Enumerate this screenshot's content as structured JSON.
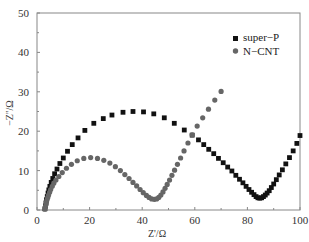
{
  "chart_data": {
    "type": "scatter",
    "title": "",
    "xlabel": "Z'/Ω",
    "ylabel": "−Z''/Ω",
    "xlim": [
      0,
      100
    ],
    "ylim": [
      0,
      50
    ],
    "xticks": [
      0,
      20,
      40,
      60,
      80,
      100
    ],
    "yticks": [
      0,
      10,
      20,
      30,
      40,
      50
    ],
    "grid": false,
    "legend_position": "upper right",
    "series": [
      {
        "name": "super−P",
        "marker": "square",
        "color": "#111111",
        "points": [
          [
            3.0,
            0.3
          ],
          [
            3.2,
            1.0
          ],
          [
            3.4,
            1.8
          ],
          [
            3.6,
            2.6
          ],
          [
            3.9,
            3.4
          ],
          [
            4.2,
            4.3
          ],
          [
            4.5,
            5.1
          ],
          [
            4.9,
            6.0
          ],
          [
            5.4,
            7.0
          ],
          [
            6.0,
            8.0
          ],
          [
            6.7,
            9.2
          ],
          [
            7.6,
            10.4
          ],
          [
            8.7,
            11.8
          ],
          [
            10.0,
            13.2
          ],
          [
            11.6,
            14.9
          ],
          [
            13.4,
            16.6
          ],
          [
            15.6,
            18.3
          ],
          [
            18.2,
            20.2
          ],
          [
            21.6,
            22.0
          ],
          [
            25.2,
            23.2
          ],
          [
            28.5,
            24.1
          ],
          [
            32.7,
            24.8
          ],
          [
            36.5,
            25.0
          ],
          [
            40.5,
            24.9
          ],
          [
            44.4,
            24.4
          ],
          [
            48.4,
            23.4
          ],
          [
            52.2,
            22.0
          ],
          [
            56.0,
            20.3
          ],
          [
            59.0,
            19.0
          ],
          [
            61.4,
            17.8
          ],
          [
            63.4,
            16.6
          ],
          [
            65.3,
            15.4
          ],
          [
            67.2,
            14.3
          ],
          [
            69.0,
            13.1
          ],
          [
            70.8,
            12.0
          ],
          [
            72.5,
            10.9
          ],
          [
            74.1,
            9.9
          ],
          [
            75.6,
            8.8
          ],
          [
            77.0,
            7.8
          ],
          [
            78.3,
            6.9
          ],
          [
            79.5,
            6.0
          ],
          [
            80.6,
            5.2
          ],
          [
            81.6,
            4.5
          ],
          [
            82.5,
            3.9
          ],
          [
            83.3,
            3.4
          ],
          [
            84.0,
            3.1
          ],
          [
            84.7,
            3.0
          ],
          [
            85.4,
            3.1
          ],
          [
            86.1,
            3.4
          ],
          [
            86.8,
            3.8
          ],
          [
            87.5,
            4.3
          ],
          [
            88.3,
            4.9
          ],
          [
            89.1,
            5.7
          ],
          [
            90.0,
            6.6
          ],
          [
            91.0,
            7.7
          ],
          [
            92.1,
            8.9
          ],
          [
            93.3,
            10.2
          ],
          [
            94.6,
            11.7
          ],
          [
            96.0,
            13.3
          ],
          [
            97.4,
            15.0
          ],
          [
            98.8,
            16.9
          ],
          [
            100.0,
            18.9
          ]
        ]
      },
      {
        "name": "N−CNT",
        "marker": "circle",
        "color": "#666666",
        "points": [
          [
            3.0,
            0.2
          ],
          [
            3.2,
            0.8
          ],
          [
            3.4,
            1.4
          ],
          [
            3.6,
            2.0
          ],
          [
            3.8,
            2.6
          ],
          [
            4.1,
            3.2
          ],
          [
            4.4,
            3.8
          ],
          [
            4.8,
            4.5
          ],
          [
            5.2,
            5.2
          ],
          [
            5.8,
            6.0
          ],
          [
            6.4,
            6.8
          ],
          [
            7.2,
            7.6
          ],
          [
            8.3,
            8.5
          ],
          [
            9.6,
            9.5
          ],
          [
            11.2,
            10.6
          ],
          [
            13.1,
            11.6
          ],
          [
            15.3,
            12.5
          ],
          [
            17.8,
            13.1
          ],
          [
            20.4,
            13.3
          ],
          [
            23.0,
            13.1
          ],
          [
            25.4,
            12.6
          ],
          [
            27.7,
            11.9
          ],
          [
            29.8,
            11.0
          ],
          [
            31.7,
            10.0
          ],
          [
            33.4,
            9.0
          ],
          [
            35.0,
            8.0
          ],
          [
            36.5,
            7.0
          ],
          [
            37.9,
            6.1
          ],
          [
            39.2,
            5.2
          ],
          [
            40.4,
            4.4
          ],
          [
            41.6,
            3.7
          ],
          [
            42.6,
            3.2
          ],
          [
            43.6,
            2.8
          ],
          [
            44.6,
            2.7
          ],
          [
            45.5,
            2.8
          ],
          [
            46.3,
            3.2
          ],
          [
            47.1,
            3.8
          ],
          [
            47.9,
            4.6
          ],
          [
            48.7,
            5.5
          ],
          [
            49.5,
            6.5
          ],
          [
            50.4,
            7.6
          ],
          [
            51.3,
            8.8
          ],
          [
            52.3,
            10.1
          ],
          [
            53.4,
            11.6
          ],
          [
            54.6,
            13.2
          ],
          [
            55.9,
            15.0
          ],
          [
            57.4,
            17.0
          ],
          [
            59.0,
            19.1
          ],
          [
            60.9,
            21.3
          ],
          [
            63.0,
            23.4
          ],
          [
            65.2,
            25.6
          ],
          [
            67.6,
            27.9
          ],
          [
            70.0,
            30.1
          ]
        ]
      }
    ]
  },
  "legend": {
    "items": [
      {
        "label": "super−P",
        "marker": "square"
      },
      {
        "label": "N−CNT",
        "marker": "circle"
      }
    ]
  },
  "axes": {
    "x_title": "Z'/Ω",
    "y_title": "−Z''/Ω",
    "x_tick_labels": [
      "0",
      "20",
      "40",
      "60",
      "80",
      "100"
    ],
    "y_tick_labels": [
      "0",
      "10",
      "20",
      "30",
      "40",
      "50"
    ]
  }
}
